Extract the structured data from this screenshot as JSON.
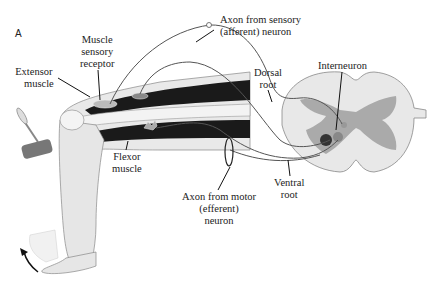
{
  "panel_label": "A",
  "labels": {
    "muscle_sensory_receptor": [
      "Muscle",
      "sensory",
      "receptor"
    ],
    "extensor_muscle": [
      "Extensor",
      "muscle"
    ],
    "axon_sensory": [
      "Axon from sensory",
      "(afferent) neuron"
    ],
    "dorsal_root": [
      "Dorsal",
      "root"
    ],
    "interneuron": "Interneuron",
    "flexor_muscle": [
      "Flexor",
      "muscle"
    ],
    "axon_motor": [
      "Axon from motor",
      "(efferent)",
      "neuron"
    ],
    "ventral_root": [
      "Ventral",
      "root"
    ]
  },
  "colors": {
    "muscle_dark": "#1a1a1a",
    "leg_fill": "#e6e6e6",
    "spinal_white": "#e8e8e8",
    "spinal_gray": "#a9a9a9",
    "nerve_line": "#555555",
    "text": "#222222"
  }
}
